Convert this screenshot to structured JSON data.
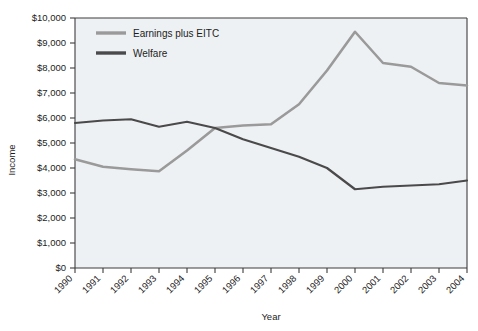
{
  "chart_data": {
    "type": "line",
    "title": "",
    "xlabel": "Year",
    "ylabel": "Income",
    "x": [
      1990,
      1991,
      1992,
      1993,
      1994,
      1995,
      1996,
      1997,
      1998,
      1999,
      2000,
      2001,
      2002,
      2003,
      2004
    ],
    "xtick_labels": [
      "1990",
      "1991",
      "1992",
      "1993",
      "1994",
      "1995",
      "1996",
      "1997",
      "1998",
      "1999",
      "2000",
      "2001",
      "2002",
      "2003",
      "2004"
    ],
    "xlim": [
      1990,
      2004
    ],
    "ylim": [
      0,
      10000
    ],
    "ytick_values": [
      0,
      1000,
      2000,
      3000,
      4000,
      5000,
      6000,
      7000,
      8000,
      9000,
      10000
    ],
    "ytick_labels": [
      "$0",
      "$1,000",
      "$2,000",
      "$3,000",
      "$4,000",
      "$5,000",
      "$6,000",
      "$7,000",
      "$8,000",
      "$9,000",
      "$10,000"
    ],
    "grid": false,
    "legend_position": "upper-left-inside",
    "series": [
      {
        "name": "Earnings plus EITC",
        "color": "#9a9a9a",
        "values": [
          4350,
          4050,
          3950,
          3870,
          4700,
          5600,
          5700,
          5750,
          6550,
          7900,
          9450,
          8200,
          8050,
          7400,
          7300
        ]
      },
      {
        "name": "Welfare",
        "color": "#4a4a4a",
        "values": [
          5800,
          5900,
          5950,
          5650,
          5850,
          5600,
          5150,
          4800,
          4450,
          4000,
          3150,
          3250,
          3300,
          3350,
          3500
        ]
      }
    ]
  },
  "legend": {
    "items": [
      {
        "label": "Earnings plus EITC"
      },
      {
        "label": "Welfare"
      }
    ]
  },
  "axes": {
    "x_title": "Year",
    "y_title": "Income"
  },
  "colors": {
    "plot_background": "#eef1f3",
    "axis_line": "#3c3c3c",
    "earnings_line": "#9a9a9a",
    "welfare_line": "#4a4a4a",
    "text": "#1d1d1d"
  }
}
